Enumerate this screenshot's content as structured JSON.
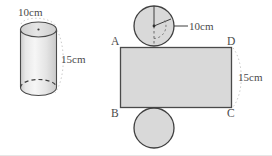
{
  "figure": {
    "colors": {
      "solid_fill": "#d9d9d9",
      "solid_fill_light": "#ececec",
      "outline": "#4a4a4a",
      "outline_dark": "#3f3f3f",
      "dimension_line": "#b5b5b5",
      "text": "#4a4a4a",
      "background": "#ffffff"
    },
    "cylinder": {
      "name": "cylinder-solid",
      "diameter_label": "10cm",
      "height_label": "15cm"
    },
    "net": {
      "name": "cylinder-net",
      "top_circle": {
        "radius_label": "10cm"
      },
      "rectangle": {
        "height_label": "15cm",
        "vertices": [
          {
            "id": "A",
            "position": "top-left"
          },
          {
            "id": "D",
            "position": "top-right"
          },
          {
            "id": "B",
            "position": "bottom-left"
          },
          {
            "id": "C",
            "position": "bottom-right"
          }
        ]
      },
      "bottom_circle": {
        "label": ""
      }
    }
  }
}
